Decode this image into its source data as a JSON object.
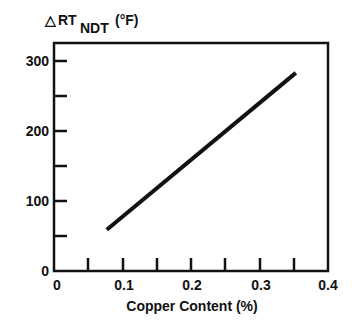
{
  "chart_data": {
    "type": "line",
    "title": "",
    "ylabel": "ΔRT NDT (°F)",
    "ylabel_parts": {
      "delta": "△",
      "main": "RT",
      "subscript": "NDT",
      "unit": "(°F)"
    },
    "xlabel": "Copper Content (%)",
    "xlim": [
      0,
      0.4
    ],
    "ylim": [
      0,
      300
    ],
    "x_ticks": [
      0,
      0.05,
      0.1,
      0.15,
      0.2,
      0.25,
      0.3,
      0.35,
      0.4
    ],
    "x_tick_labels": [
      "0",
      "0.1",
      "0.2",
      "0.3",
      "0.4"
    ],
    "y_ticks": [
      0,
      50,
      100,
      150,
      200,
      250,
      300
    ],
    "y_tick_labels": [
      "0",
      "100",
      "200",
      "300"
    ],
    "grid": false,
    "legend": null,
    "series": [
      {
        "name": "ΔRT NDT vs Copper Content",
        "x": [
          0.077,
          0.353
        ],
        "y": [
          59,
          283
        ]
      }
    ]
  },
  "labels": {
    "y_title_delta": "△",
    "y_title_main": "RT",
    "y_title_sub": "NDT",
    "y_title_unit": "(°F)",
    "x_title": "Copper Content (%)",
    "x_ticks": [
      "0",
      "0.1",
      "0.2",
      "0.3",
      "0.4"
    ],
    "y_ticks": [
      "0",
      "100",
      "200",
      "300"
    ]
  }
}
